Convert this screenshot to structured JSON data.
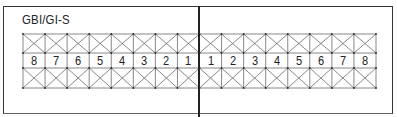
{
  "diagram": {
    "title": "GBI/GI-S",
    "left_half_labels": [
      "8",
      "7",
      "6",
      "5",
      "4",
      "3",
      "2",
      "1"
    ],
    "right_half_labels": [
      "1",
      "2",
      "3",
      "4",
      "5",
      "6",
      "7",
      "8"
    ],
    "rows": [
      "cross-braced-row-top",
      "number-row",
      "cross-braced-row-bottom"
    ],
    "colors": {
      "line": "#555555",
      "frame": "#333333",
      "background": "#ffffff"
    }
  }
}
